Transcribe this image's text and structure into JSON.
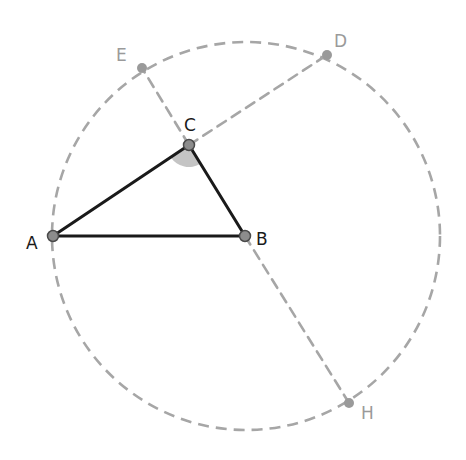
{
  "diagram": {
    "colors": {
      "triangle_stroke": "#1a1a1a",
      "dashed_stroke": "#a6a6a6",
      "point_fill": "#8c8c8c",
      "light_point_fill": "#9a9a9a",
      "angle_fill": "#c4c4c4",
      "dark_label": "#1a1a1a",
      "light_label": "#9a9a9a"
    },
    "circle": {
      "cx": 246,
      "cy": 236,
      "r": 194,
      "style": "dashed"
    },
    "points": {
      "A": {
        "label": "A",
        "x": 53,
        "y": 236
      },
      "B": {
        "label": "B",
        "x": 245,
        "y": 236
      },
      "C": {
        "label": "C",
        "x": 189,
        "y": 145
      },
      "D": {
        "label": "D",
        "x": 327,
        "y": 55
      },
      "E": {
        "label": "E",
        "x": 142,
        "y": 68
      },
      "H": {
        "label": "H",
        "x": 349,
        "y": 403
      }
    },
    "segments_solid": [
      "AB",
      "BC",
      "CA"
    ],
    "segments_dashed": [
      "CE",
      "CD",
      "BH"
    ],
    "angle_marker": {
      "at": "C",
      "between": [
        "CA",
        "CB"
      ],
      "style": "filled sector"
    }
  }
}
